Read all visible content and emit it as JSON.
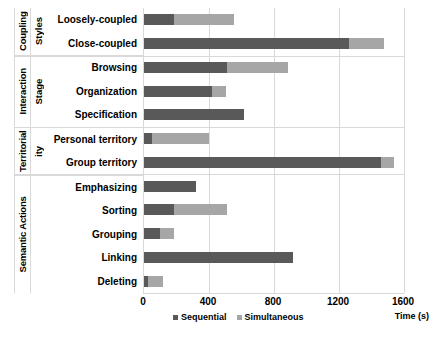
{
  "chart_data": {
    "type": "bar",
    "orientation": "horizontal",
    "stacked": true,
    "title": "",
    "xlabel": "Time (s)",
    "ylabel": "",
    "xlim": [
      0,
      1600
    ],
    "xticks": [
      0,
      400,
      800,
      1200,
      1600
    ],
    "grid": true,
    "legend_position": "bottom",
    "legend": [
      "Sequential",
      "Simultaneous"
    ],
    "colors": {
      "sequential": "#595959",
      "simultaneous": "#a6a6a6"
    },
    "groups": [
      {
        "name": "Coupling",
        "subname": "Styles",
        "categories": [
          "Loosely-coupled",
          "Close-coupled"
        ]
      },
      {
        "name": "Interaction",
        "subname": "Stage",
        "categories": [
          "Browsing",
          "Organization",
          "Specification"
        ]
      },
      {
        "name": "Territorial",
        "subname": "ity",
        "categories": [
          "Personal territory",
          "Group territory"
        ]
      },
      {
        "name": "Semantic Actions",
        "subname": "",
        "categories": [
          "Emphasizing",
          "Sorting",
          "Grouping",
          "Linking",
          "Deleting"
        ]
      }
    ],
    "categories": [
      "Loosely-coupled",
      "Close-coupled",
      "Browsing",
      "Organization",
      "Specification",
      "Personal territory",
      "Group territory",
      "Emphasizing",
      "Sorting",
      "Grouping",
      "Linking",
      "Deleting"
    ],
    "series": [
      {
        "name": "Sequential",
        "color": "#595959",
        "values": [
          185,
          1262,
          508,
          420,
          615,
          50,
          1458,
          320,
          185,
          98,
          917,
          25
        ]
      },
      {
        "name": "Simultaneous",
        "color": "#a6a6a6",
        "values": [
          369,
          215,
          378,
          85,
          0,
          350,
          80,
          0,
          327,
          87,
          0,
          92
        ]
      }
    ],
    "totals": [
      554,
      1477,
      886,
      505,
      615,
      400,
      1538,
      320,
      512,
      185,
      917,
      117
    ]
  }
}
